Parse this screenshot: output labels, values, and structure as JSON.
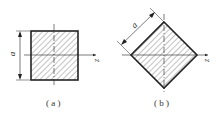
{
  "figures": [
    {
      "id": "a",
      "caption": "( a )",
      "dimension_label": "a",
      "axis_label": "z",
      "shape": "square"
    },
    {
      "id": "b",
      "caption": "( b )",
      "dimension_label": "a",
      "axis_label": "z",
      "shape": "diamond"
    }
  ],
  "colors": {
    "stroke": "#222222",
    "hatch": "#555555"
  }
}
